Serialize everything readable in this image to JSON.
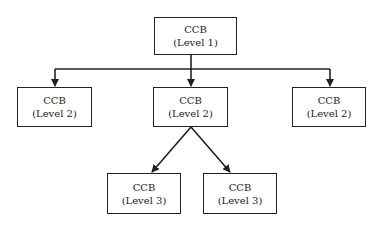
{
  "diagram": {
    "type": "hierarchy",
    "nodes": [
      {
        "id": "l1",
        "title": "CCB",
        "subtitle": "(Level 1)"
      },
      {
        "id": "l2a",
        "title": "CCB",
        "subtitle": "(Level 2)"
      },
      {
        "id": "l2b",
        "title": "CCB",
        "subtitle": "(Level 2)"
      },
      {
        "id": "l2c",
        "title": "CCB",
        "subtitle": "(Level 2)"
      },
      {
        "id": "l3a",
        "title": "CCB",
        "subtitle": "(Level 3)"
      },
      {
        "id": "l3b",
        "title": "CCB",
        "subtitle": "(Level 3)"
      }
    ],
    "edges": [
      {
        "from": "l1",
        "to": "l2a"
      },
      {
        "from": "l1",
        "to": "l2b"
      },
      {
        "from": "l1",
        "to": "l2c"
      },
      {
        "from": "l2b",
        "to": "l3a"
      },
      {
        "from": "l2b",
        "to": "l3b"
      }
    ],
    "colors": {
      "line": "#222222",
      "box_fill": "#ffffff",
      "text": "#222222"
    }
  }
}
